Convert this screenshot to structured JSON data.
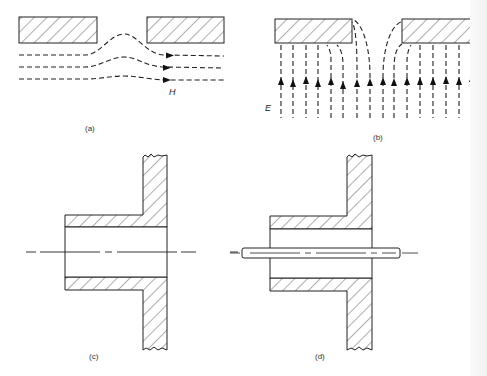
{
  "figure": {
    "panels": [
      {
        "id": "a",
        "caption": "(a)",
        "field_symbol": "H",
        "description": "Magnetic field lines passing beneath a slotted conducting plate, bulging up into the aperture",
        "field_line_count": 3,
        "arrow_direction": "right"
      },
      {
        "id": "b",
        "caption": "(b)",
        "field_symbol": "E",
        "description": "Electric field lines terminating normally on a conducting plate and fringing into the aperture",
        "field_line_count": 14,
        "arrow_direction": "up"
      },
      {
        "id": "c",
        "caption": "(c)",
        "description": "Cross-section of a hollow tube (waveguide beyond cutoff) mounted through a wall, with centerline"
      },
      {
        "id": "d",
        "caption": "(d)",
        "description": "Same tube with a conducting rod passing through along the axis"
      }
    ]
  }
}
